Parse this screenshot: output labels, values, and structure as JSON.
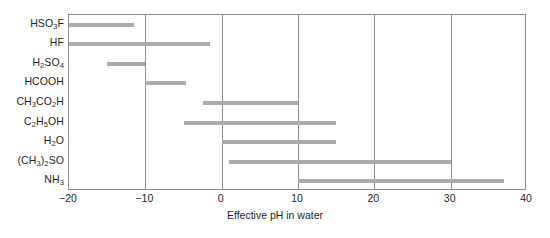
{
  "chart_data": {
    "type": "bar",
    "orientation": "horizontal",
    "title": "",
    "subtitle": "",
    "xlabel": "Effective pH in water",
    "ylabel": "",
    "xlim": [
      -20,
      40
    ],
    "ylim": [
      0,
      9
    ],
    "grid": true,
    "grid_axis": "x",
    "legend": "none",
    "bar_color": "#aaabad",
    "frame_color": "#8d8d8d",
    "text_color": "#231f20",
    "xticks": [
      -20,
      -10,
      0,
      10,
      20,
      30,
      40
    ],
    "xticklabels": [
      "−20",
      "−10",
      "0",
      "10",
      "20",
      "30",
      "40"
    ],
    "categories": [
      "HSO3F",
      "HF",
      "H2SO4",
      "HCOOH",
      "CH3CO2H",
      "C2H5OH",
      "H2O",
      "(CH3)2SO",
      "NH3"
    ],
    "category_labels_html": [
      "HSO<sub>3</sub>F",
      "HF",
      "H<sub>2</sub>SO<sub>4</sub>",
      "HCOOH",
      "CH<sub>3</sub>CO<sub>2</sub>H",
      "C<sub>2</sub>H<sub>5</sub>OH",
      "H<sub>2</sub>O",
      "(CH<sub>3</sub>)<sub>2</sub>SO",
      "NH<sub>3</sub>"
    ],
    "ranges": [
      {
        "category": "HSO3F",
        "start": -20.0,
        "end": -11.5
      },
      {
        "category": "HF",
        "start": -20.0,
        "end": -1.5
      },
      {
        "category": "H2SO4",
        "start": -15.0,
        "end": -10.0
      },
      {
        "category": "HCOOH",
        "start": -10.0,
        "end": -4.7
      },
      {
        "category": "CH3CO2H",
        "start": -2.5,
        "end": 10.0
      },
      {
        "category": "C2H5OH",
        "start": -5.0,
        "end": 15.0
      },
      {
        "category": "H2O",
        "start": 0.0,
        "end": 15.0
      },
      {
        "category": "(CH3)2SO",
        "start": 1.0,
        "end": 30.0
      },
      {
        "category": "NH3",
        "start": 10.0,
        "end": 37.0
      }
    ]
  }
}
